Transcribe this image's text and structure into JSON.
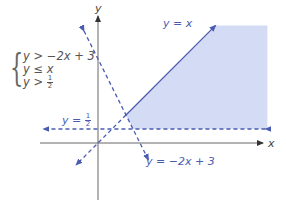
{
  "system": {
    "inequalities": [
      {
        "lhs": "y",
        "op": ">",
        "rhs": "−2x + 3"
      },
      {
        "lhs": "y",
        "op": "≤",
        "rhs": "x"
      },
      {
        "lhs": "y",
        "op": ">",
        "rhs_num": "1",
        "rhs_den": "2"
      }
    ]
  },
  "axes": {
    "x_label": "x",
    "y_label": "y"
  },
  "lines": {
    "y_eq_x": {
      "label": "y = x",
      "slope": 1,
      "intercept": 0,
      "style": "solid-on-boundary"
    },
    "y_eq_neg2x_plus3": {
      "label": "y = −2x + 3",
      "slope": -2,
      "intercept": 3,
      "style": "dashed"
    },
    "y_eq_half": {
      "label_prefix": "y = ",
      "num": "1",
      "den": "2",
      "value": 0.5,
      "style": "dashed"
    }
  },
  "colors": {
    "line": "#4a5cb0",
    "shade": "#d4dbf5",
    "axis": "#666666",
    "text": "#555555"
  }
}
